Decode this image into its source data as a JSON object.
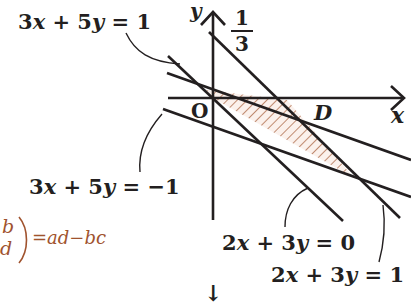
{
  "diagram": {
    "axes": {
      "x_label": "x",
      "y_label": "y",
      "origin_label": "O"
    },
    "region_label": "D",
    "fraction": {
      "numerator": "1",
      "denominator": "3"
    },
    "lines": [
      {
        "id": "l1",
        "equation": "3x + 5y = 1",
        "label_parts": [
          "3",
          "x",
          " + 5",
          "y",
          " = 1"
        ]
      },
      {
        "id": "l2",
        "equation": "3x + 5y = −1",
        "label_parts": [
          "3",
          "x",
          " + 5",
          "y",
          " = −1"
        ]
      },
      {
        "id": "l3",
        "equation": "2x + 3y = 0",
        "label_parts": [
          "2",
          "x",
          " + 3",
          "y",
          " = 0"
        ]
      },
      {
        "id": "l4",
        "equation": "2x + 3y = 1",
        "label_parts": [
          "2",
          "x",
          " + 3",
          "y",
          " = 1"
        ]
      }
    ],
    "determinant_fragment": {
      "top": "b",
      "bottom": "d",
      "rhs": "=ad−bc"
    },
    "down_arrow": "↓",
    "colors": {
      "ink": "#231f20",
      "hatch": "#a0532e",
      "fill": "#fbf1ec",
      "accent_text": "#a0532e"
    }
  }
}
